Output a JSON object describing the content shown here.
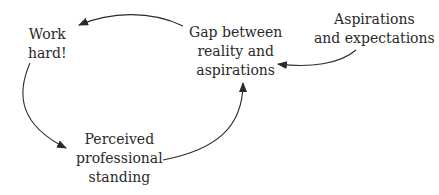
{
  "diagram": {
    "type": "causal-loop",
    "nodes": {
      "work_hard": {
        "lines": [
          "Work",
          "hard!"
        ]
      },
      "gap": {
        "lines": [
          "Gap between",
          "reality and",
          "aspirations"
        ]
      },
      "aspirations": {
        "lines": [
          "Aspirations",
          "and expectations"
        ]
      },
      "standing": {
        "lines": [
          "Perceived",
          "professional",
          "standing"
        ]
      }
    },
    "edges": [
      {
        "from": "Gap between reality and aspirations",
        "to": "Work hard!"
      },
      {
        "from": "Work hard!",
        "to": "Perceived professional standing"
      },
      {
        "from": "Perceived professional standing",
        "to": "Gap between reality and aspirations"
      },
      {
        "from": "Aspirations and expectations",
        "to": "Gap between reality and aspirations"
      }
    ],
    "colors": {
      "text": "#2a2a2a",
      "line": "#2a2a2a",
      "background": "#ffffff"
    }
  }
}
